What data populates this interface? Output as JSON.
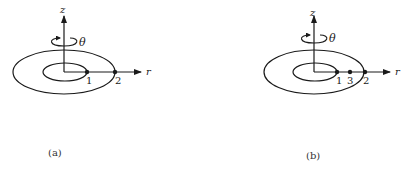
{
  "colors": {
    "ink": "#1a1a1a",
    "background": "#ffffff"
  },
  "panels": [
    {
      "id": "a",
      "caption": "(a)",
      "axis_z_label": "z",
      "axis_r_label": "r",
      "rotation_label": "θ",
      "points": [
        {
          "label": "1",
          "position": "inner ring on r-axis"
        },
        {
          "label": "2",
          "position": "outer ring on r-axis"
        }
      ]
    },
    {
      "id": "b",
      "caption": "(b)",
      "axis_z_label": "z",
      "axis_r_label": "r",
      "rotation_label": "θ",
      "points": [
        {
          "label": "1",
          "position": "inner ring on r-axis"
        },
        {
          "label": "3",
          "position": "between rings on r-axis"
        },
        {
          "label": "2",
          "position": "outer ring on r-axis"
        }
      ]
    }
  ]
}
